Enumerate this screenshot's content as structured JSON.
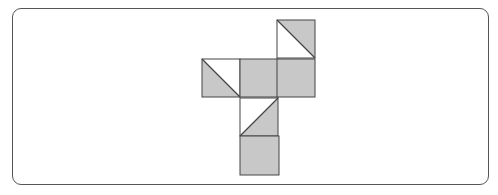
{
  "diagram": {
    "fill_color": "#c8c8c8",
    "stroke_color": "#444444",
    "frame": {
      "x": 12,
      "y": 8,
      "width": 477,
      "height": 177,
      "radius": 9
    },
    "squares": [
      {
        "id": "top-right",
        "x": 277,
        "y": 20,
        "size": 38,
        "fill": "diagonal",
        "diagonal": "tl-br",
        "shaded_half": "upper-right"
      },
      {
        "id": "middle-left",
        "x": 202,
        "y": 59,
        "size": 38,
        "fill": "diagonal",
        "diagonal": "tl-br",
        "shaded_half": "lower-left"
      },
      {
        "id": "middle-center",
        "x": 240,
        "y": 59,
        "size": 38,
        "fill": "full"
      },
      {
        "id": "middle-right",
        "x": 277,
        "y": 59,
        "size": 38,
        "fill": "full"
      },
      {
        "id": "lower",
        "x": 240,
        "y": 98,
        "size": 38,
        "fill": "diagonal",
        "diagonal": "bl-tr",
        "shaded_half": "lower-right"
      },
      {
        "id": "bottom",
        "x": 240,
        "y": 136,
        "size": 39,
        "fill": "full"
      }
    ]
  }
}
